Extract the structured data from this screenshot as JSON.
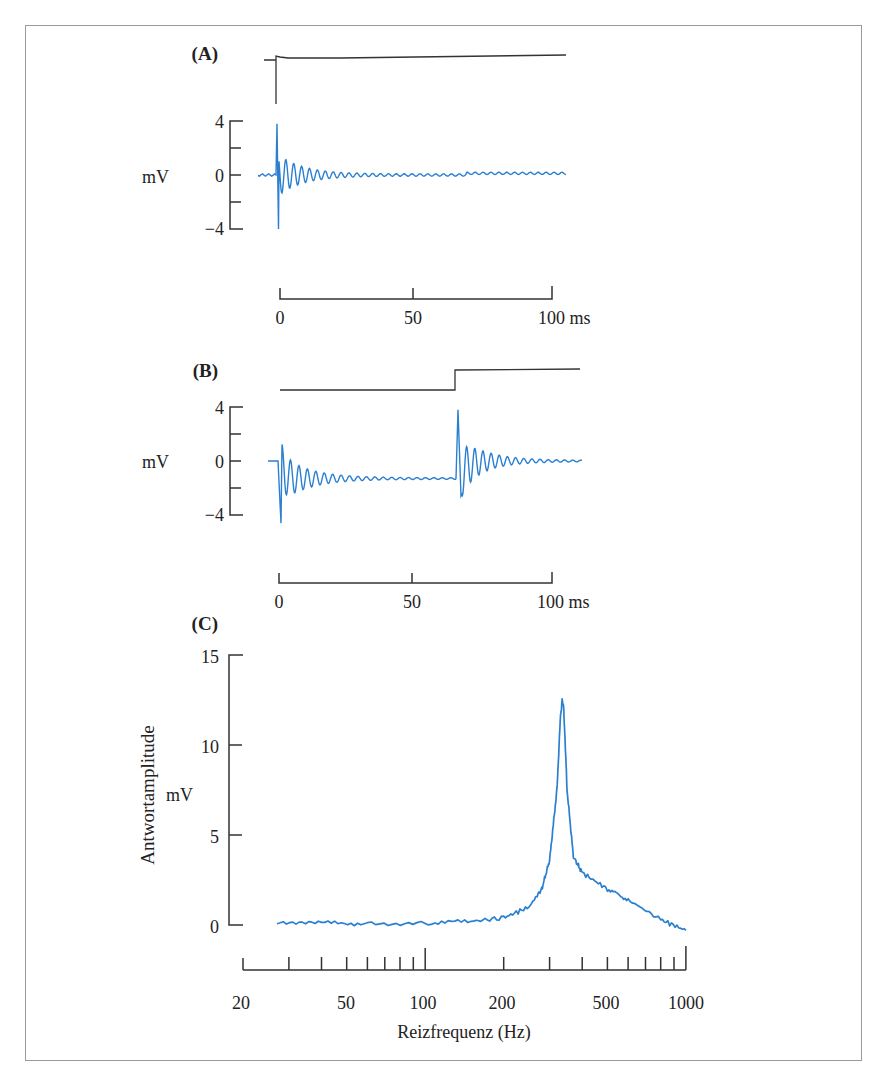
{
  "colors": {
    "trace": "#2a7fd0",
    "stimulus": "#333333",
    "axis": "#333333",
    "frame": "#9a9a9a"
  },
  "panelA": {
    "label": "(A)",
    "y_unit": "mV",
    "y_ticks": [
      "4",
      "0",
      "−4"
    ],
    "x_ticks": [
      "0",
      "50",
      "100 ms"
    ]
  },
  "panelB": {
    "label": "(B)",
    "y_unit": "mV",
    "y_ticks": [
      "4",
      "0",
      "−4"
    ],
    "x_ticks": [
      "0",
      "50",
      "100 ms"
    ]
  },
  "panelC": {
    "label": "(C)",
    "y_label": "Antwortamplitude",
    "y_unit": "mV",
    "y_ticks": [
      "15",
      "10",
      "5",
      "0"
    ],
    "x_ticks": [
      "20",
      "50",
      "100",
      "200",
      "500",
      "1000"
    ],
    "x_label": "Reizfrequenz (Hz)"
  },
  "chart_data": [
    {
      "type": "line",
      "title": "(A) Impulse response to a single step stimulus",
      "xlabel": "ms",
      "ylabel": "mV",
      "xlim": [
        0,
        105
      ],
      "ylim": [
        -4,
        4
      ],
      "x_ticks": [
        0,
        50,
        100
      ],
      "y_ticks": [
        -4,
        -2,
        0,
        2,
        4
      ],
      "series": [
        {
          "name": "stimulus",
          "description": "step at t=0"
        },
        {
          "name": "response",
          "description": "damped oscillation starting at t=0, peak +3.8 mV / -4 mV, decays within ~25 ms",
          "x": [
            0,
            1,
            2,
            4,
            6,
            8,
            10,
            15,
            20,
            25,
            50,
            100
          ],
          "y": [
            3.8,
            -4.0,
            1.5,
            1.3,
            1.1,
            0.9,
            0.7,
            0.5,
            0.3,
            0.1,
            0.0,
            0.1
          ]
        }
      ]
    },
    {
      "type": "line",
      "title": "(B) Response to step on and step off",
      "xlabel": "ms",
      "ylabel": "mV",
      "xlim": [
        -4,
        110
      ],
      "ylim": [
        -4,
        4
      ],
      "x_ticks": [
        0,
        50,
        100
      ],
      "y_ticks": [
        -4,
        -2,
        0,
        2,
        4
      ],
      "series": [
        {
          "name": "stimulus",
          "description": "step at ~65 ms"
        },
        {
          "name": "response",
          "description": "damped oscillation at t=0 settling at ~-1.3 mV, second damped oscillation at ~65 ms returning to 0",
          "x": [
            0,
            1,
            3,
            10,
            30,
            64,
            65,
            66,
            70,
            80,
            110
          ],
          "y": [
            0,
            -4.6,
            1.0,
            -0.8,
            -1.2,
            -1.3,
            3.8,
            -2.6,
            1.2,
            0.2,
            0.0
          ]
        }
      ]
    },
    {
      "type": "line",
      "title": "(C) Frequency tuning curve",
      "xlabel": "Reizfrequenz (Hz)",
      "ylabel": "Antwortamplitude mV",
      "x_scale": "log",
      "xlim": [
        20,
        1000
      ],
      "ylim": [
        0,
        15
      ],
      "x_ticks": [
        20,
        50,
        100,
        200,
        500,
        1000
      ],
      "y_ticks": [
        0,
        5,
        10,
        15
      ],
      "series": [
        {
          "name": "amplitude",
          "x": [
            27,
            40,
            60,
            100,
            150,
            200,
            250,
            280,
            300,
            320,
            330,
            335,
            340,
            350,
            370,
            400,
            500,
            600,
            800,
            1000
          ],
          "y": [
            0.2,
            0.1,
            0.1,
            0.1,
            0.2,
            0.4,
            1.0,
            2.0,
            3.6,
            7.5,
            11.5,
            12.5,
            12.0,
            7.5,
            3.8,
            2.9,
            2.0,
            1.4,
            0.3,
            -0.3
          ]
        }
      ]
    }
  ]
}
